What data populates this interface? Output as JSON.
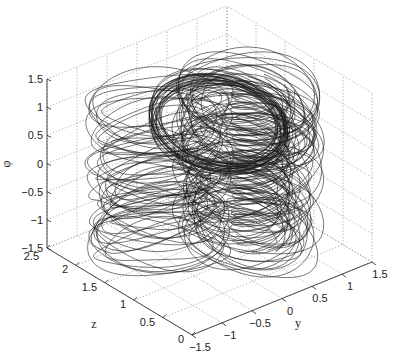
{
  "chart_data": {
    "type": "line3d",
    "title": "",
    "axes": {
      "x": {
        "label": "y",
        "ticks": [
          "-1.5",
          "-1",
          "-0.5",
          "0",
          "0.5",
          "1",
          "1.5"
        ],
        "range": [
          -1.5,
          1.5
        ]
      },
      "y": {
        "label": "z",
        "ticks": [
          "0",
          "0.5",
          "1",
          "1.5",
          "2",
          "2.5"
        ],
        "range": [
          0,
          2.5
        ]
      },
      "z": {
        "label": "φ",
        "ticks": [
          "-1.5",
          "-1",
          "-0.5",
          "0",
          "0.5",
          "1",
          "1.5"
        ],
        "range": [
          -1.5,
          1.5
        ]
      }
    },
    "grid": true,
    "line_color": "#222222",
    "layers_phi": [
      -1.2,
      -0.75,
      -0.25,
      0.25,
      0.75,
      1.2
    ]
  },
  "labels": {
    "phi": "φ",
    "z": "z",
    "y": "y"
  },
  "phi_ticks": [
    "1.5",
    "1",
    "0.5",
    "0",
    "-0.5",
    "-1",
    "-1.5"
  ],
  "z_ticks": [
    "2.5",
    "2",
    "1.5",
    "1",
    "0.5",
    "0"
  ],
  "y_ticks": [
    "-1.5",
    "-1",
    "-0.5",
    "0",
    "0.5",
    "1",
    "1.5"
  ]
}
